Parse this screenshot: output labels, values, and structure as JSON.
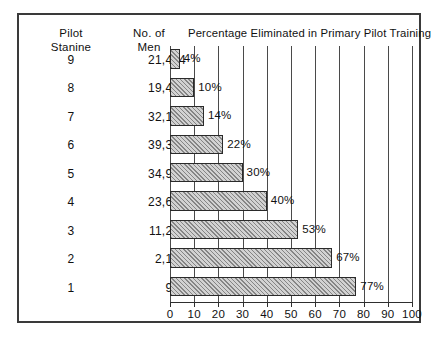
{
  "figure": {
    "title": "Percentage Eliminated in Primary Pilot Training",
    "columns": {
      "stanine_header": "Pilot\nStanine",
      "men_header": "No. of\nMen"
    },
    "frame_color": "#3a3a3a",
    "bar_fill_color": "#d2d2d2",
    "bar_border_color": "#2a2a2a"
  },
  "chart_data": {
    "type": "bar",
    "orientation": "horizontal",
    "title": "Percentage Eliminated in Primary Pilot Training",
    "xlabel": "",
    "ylabel": "",
    "xlim": [
      0,
      100
    ],
    "xticks": [
      0,
      10,
      20,
      30,
      40,
      50,
      60,
      70,
      80,
      90,
      100
    ],
    "xtick_labels": [
      "0",
      "10",
      "20",
      "30",
      "40",
      "50",
      "60",
      "70",
      "80",
      "90",
      "100"
    ],
    "grid": true,
    "legend": false,
    "categories": [
      "9",
      "8",
      "7",
      "6",
      "5",
      "4",
      "3",
      "2",
      "1"
    ],
    "category_label": "Pilot Stanine",
    "values": [
      4,
      10,
      14,
      22,
      30,
      40,
      53,
      67,
      77
    ],
    "value_labels": [
      "4%",
      "10%",
      "14%",
      "22%",
      "30%",
      "40%",
      "53%",
      "67%",
      "77%"
    ],
    "extra_series": {
      "name": "No. of Men",
      "values": [
        21474,
        19444,
        32129,
        39398,
        34975,
        23699,
        11209,
        2139,
        904
      ],
      "labels": [
        "21,474",
        "19,444",
        "32,129",
        "39,398",
        "34,975",
        "23,699",
        "11,209",
        "2,139",
        "904"
      ]
    },
    "rows": [
      {
        "stanine": "9",
        "men": "21,474",
        "percent": 4,
        "percent_label": "4%"
      },
      {
        "stanine": "8",
        "men": "19,444",
        "percent": 10,
        "percent_label": "10%"
      },
      {
        "stanine": "7",
        "men": "32,129",
        "percent": 14,
        "percent_label": "14%"
      },
      {
        "stanine": "6",
        "men": "39,398",
        "percent": 22,
        "percent_label": "22%"
      },
      {
        "stanine": "5",
        "men": "34,975",
        "percent": 30,
        "percent_label": "30%"
      },
      {
        "stanine": "4",
        "men": "23,699",
        "percent": 40,
        "percent_label": "40%"
      },
      {
        "stanine": "3",
        "men": "11,209",
        "percent": 53,
        "percent_label": "53%"
      },
      {
        "stanine": "2",
        "men": "2,139",
        "percent": 67,
        "percent_label": "67%"
      },
      {
        "stanine": "1",
        "men": "904",
        "percent": 77,
        "percent_label": "77%"
      }
    ]
  }
}
